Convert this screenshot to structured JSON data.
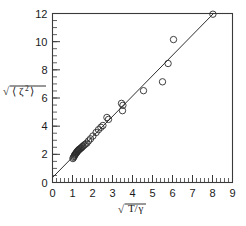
{
  "chart_data": {
    "type": "scatter",
    "title": "",
    "xlabel": "sqrt(T/gamma)",
    "ylabel": "sqrt(<zeta^2>)",
    "xlabel_parts": {
      "radical": "√",
      "numerator": "T",
      "slash": "/",
      "denominator": "γ"
    },
    "ylabel_parts": {
      "radical": "√",
      "bracket_open": "⟨",
      "symbol": "ζ",
      "exponent": "2",
      "bracket_close": "⟩"
    },
    "xlim": [
      0,
      9
    ],
    "ylim": [
      0,
      12
    ],
    "xticks": [
      0,
      1,
      2,
      3,
      4,
      5,
      6,
      7,
      8,
      9
    ],
    "xtick_labels": [
      "0",
      "1",
      "2",
      "3",
      "4",
      "5",
      "6",
      "7",
      "8",
      "9"
    ],
    "yticks": [
      0,
      2,
      4,
      6,
      8,
      10,
      12
    ],
    "ytick_labels": [
      "0",
      "2",
      "4",
      "6",
      "8",
      "10",
      "12"
    ],
    "x_minor_per_major": 5,
    "y_minor_per_major": 4,
    "grid": false,
    "legend": null,
    "marker": "open-circle",
    "marker_radius_px": 3.2,
    "fit_line": {
      "x_start": 0.0,
      "y_start": 0.35,
      "x_end": 8.05,
      "y_end": 12.0,
      "slope": 1.447,
      "intercept": 0.35
    },
    "points": [
      [
        1.02,
        1.7
      ],
      [
        1.05,
        1.78
      ],
      [
        1.08,
        1.85
      ],
      [
        1.1,
        1.92
      ],
      [
        1.12,
        1.98
      ],
      [
        1.15,
        2.02
      ],
      [
        1.18,
        2.08
      ],
      [
        1.2,
        2.12
      ],
      [
        1.22,
        2.18
      ],
      [
        1.25,
        2.22
      ],
      [
        1.28,
        2.26
      ],
      [
        1.3,
        2.3
      ],
      [
        1.33,
        2.34
      ],
      [
        1.36,
        2.38
      ],
      [
        1.4,
        2.42
      ],
      [
        1.44,
        2.46
      ],
      [
        1.48,
        2.52
      ],
      [
        1.52,
        2.58
      ],
      [
        1.58,
        2.65
      ],
      [
        1.64,
        2.72
      ],
      [
        1.72,
        2.8
      ],
      [
        1.8,
        2.95
      ],
      [
        1.9,
        3.1
      ],
      [
        2.02,
        3.3
      ],
      [
        2.18,
        3.55
      ],
      [
        2.3,
        3.75
      ],
      [
        2.42,
        3.92
      ],
      [
        2.52,
        4.05
      ],
      [
        2.72,
        4.62
      ],
      [
        2.8,
        4.48
      ],
      [
        3.45,
        5.62
      ],
      [
        3.52,
        5.48
      ],
      [
        3.5,
        5.1
      ],
      [
        4.55,
        6.52
      ],
      [
        5.5,
        7.15
      ],
      [
        5.78,
        8.45
      ],
      [
        6.05,
        10.15
      ],
      [
        8.02,
        11.95
      ]
    ]
  },
  "figure": {
    "background_color": "#ffffff",
    "axis_color": "#3a3a3a",
    "marker_color": "#2b2b2b",
    "line_color": "#2e2e2e"
  }
}
